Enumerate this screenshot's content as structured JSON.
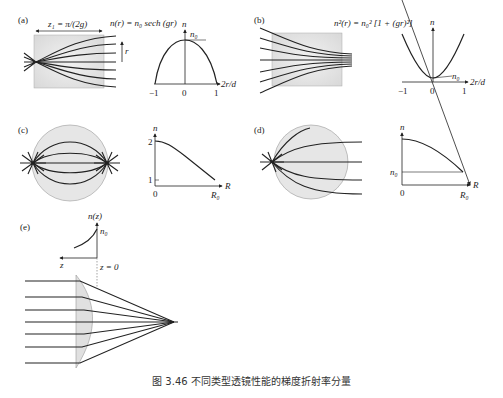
{
  "figure": {
    "caption": "图 3.46   不同类型透镜性能的梯度折射率分量",
    "panels": {
      "a": {
        "tag": "(a)",
        "length_label": "z₁ = π/(2g)",
        "formula": "n(r) = n₀ sech (gr)",
        "axis_r": "r",
        "graph": {
          "y_label": "n",
          "peak_label": "n₀",
          "x_label": "2r/d",
          "ticks": [
            "−1",
            "0",
            "1"
          ]
        }
      },
      "b": {
        "tag": "(b)",
        "formula": "n²(r) = n₀² [1 + (gr)²]",
        "graph": {
          "y_label": "n",
          "min_label": "n₀",
          "x_label": "2r/d",
          "ticks": [
            "−1",
            "0",
            "1"
          ]
        }
      },
      "c": {
        "tag": "(c)",
        "graph": {
          "y_label": "n",
          "y_ticks": [
            "2",
            "1"
          ],
          "x_label": "R",
          "x_ticks": [
            "0",
            "R₀"
          ]
        }
      },
      "d": {
        "tag": "(d)",
        "graph": {
          "y_label": "n",
          "y_tick": "n₀",
          "x_label": "R",
          "x_ticks": [
            "0",
            "R₀"
          ]
        }
      },
      "e": {
        "tag": "(e)",
        "graph": {
          "y_label": "n(z)",
          "peak_label": "n₀",
          "x_label": "z",
          "origin_label": "z = 0"
        }
      }
    }
  }
}
